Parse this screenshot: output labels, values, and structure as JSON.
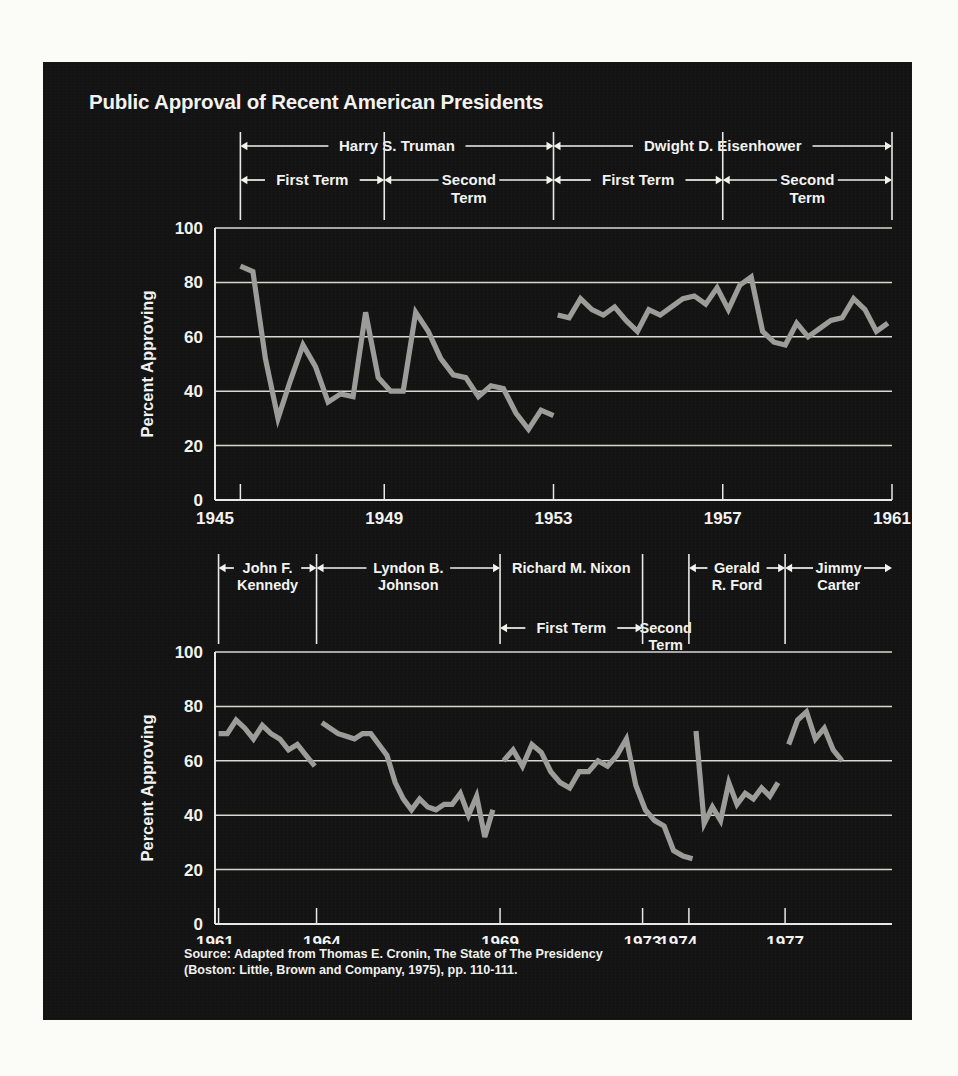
{
  "title": "Public Approval of Recent American Presidents",
  "source": "Source: Adapted from Thomas E. Cronin, The State of The Presidency\n(Boston: Little, Brown and Company, 1975), pp. 110-111.",
  "colors": {
    "panel_background": "#131313",
    "page_background": "#fbfbf8",
    "text": "#f2f2f0",
    "axis": "#e8e8e6",
    "gridline": "#d8d8d4",
    "data_line": "#9c9c9a"
  },
  "axis": {
    "ylabel": "Percent Approving",
    "yticks": [
      0,
      20,
      40,
      60,
      80,
      100
    ],
    "ylim": [
      0,
      100
    ]
  },
  "top_chart": {
    "xticks": [
      "1945",
      "1949",
      "1953",
      "1957",
      "1961"
    ],
    "xlim": [
      1945,
      1961
    ],
    "brackets_row1": [
      {
        "label": "Harry S. Truman",
        "start": 1945.6,
        "end": 1953.0
      },
      {
        "label": "Dwight D. Eisenhower",
        "start": 1953.0,
        "end": 1961.0
      }
    ],
    "brackets_row2": [
      {
        "label": "First Term",
        "start": 1945.6,
        "end": 1949.0
      },
      {
        "label": "Second\nTerm",
        "start": 1949.0,
        "end": 1953.0
      },
      {
        "label": "First Term",
        "start": 1953.0,
        "end": 1957.0
      },
      {
        "label": "Second\nTerm",
        "start": 1957.0,
        "end": 1961.0
      }
    ],
    "dividers": [
      1945.6,
      1949.0,
      1953.0,
      1957.0,
      1961.0
    ]
  },
  "bottom_chart": {
    "xticks": [
      "1961",
      "1964",
      "1969",
      "1973",
      "1974",
      "1977"
    ],
    "xlim": [
      1961,
      1980
    ],
    "brackets_row1": [
      {
        "label": "John F.\nKennedy",
        "start": 1961.1,
        "end": 1963.85
      },
      {
        "label": "Lyndon B.\nJohnson",
        "start": 1963.85,
        "end": 1969.0
      },
      {
        "label": "Richard M. Nixon",
        "start": 1969.0,
        "end": 1973.0
      },
      {
        "label": "Gerald\nR. Ford",
        "start": 1974.3,
        "end": 1977.0
      },
      {
        "label": "Jimmy\nCarter",
        "start": 1977.0,
        "end": 1980.0
      }
    ],
    "brackets_row2": [
      {
        "label": "First Term",
        "start": 1969.0,
        "end": 1973.0
      },
      {
        "label": "Second\nTerm",
        "start": 1973.0,
        "end": 1974.3
      }
    ],
    "dividers": [
      1961.1,
      1963.85,
      1969.0,
      1973.0,
      1974.3,
      1977.0
    ]
  },
  "chart_data": {
    "type": "line",
    "title": "Public Approval of Recent American Presidents",
    "xlabel": "",
    "ylabel": "Percent Approving",
    "ylim": [
      0,
      100
    ],
    "grid": true,
    "legend": "none",
    "panels": [
      {
        "name": "top",
        "xlim": [
          1945,
          1961
        ],
        "xticks": [
          1945,
          1949,
          1953,
          1957,
          1961
        ],
        "series": [
          {
            "name": "Harry S. Truman",
            "x": [
              1945.6,
              1945.9,
              1946.3,
              1946.7,
              1947.0,
              1947.3,
              1947.6,
              1948.0,
              1948.3,
              1948.6,
              1948.9,
              1949.1,
              1949.4,
              1949.8,
              1950.1,
              1950.4,
              1950.7,
              1951.0,
              1951.3,
              1951.6,
              1951.9,
              1952.2,
              1952.5,
              1952.8,
              1953.0
            ],
            "y": [
              86,
              84,
              52,
              30,
              44,
              57,
              49,
              36,
              39,
              38,
              69,
              45,
              40,
              40,
              69,
              62,
              52,
              46,
              45,
              38,
              42,
              41,
              32,
              26,
              33,
              31
            ]
          },
          {
            "name": "Dwight D. Eisenhower",
            "x": [
              1953.1,
              1953.4,
              1953.7,
              1954.0,
              1954.3,
              1954.6,
              1954.9,
              1955.2,
              1955.5,
              1955.8,
              1956.1,
              1956.4,
              1956.7,
              1957.0,
              1957.3,
              1957.6,
              1957.9,
              1958.2,
              1958.5,
              1958.8,
              1959.1,
              1959.4,
              1959.7,
              1960.0,
              1960.3,
              1960.6,
              1960.9
            ],
            "y": [
              68,
              67,
              74,
              70,
              68,
              71,
              66,
              62,
              70,
              68,
              71,
              74,
              75,
              72,
              78,
              70,
              79,
              82,
              62,
              58,
              57,
              65,
              60,
              63,
              66,
              67,
              74,
              70,
              62,
              65
            ]
          }
        ]
      },
      {
        "name": "bottom",
        "xlim": [
          1961,
          1980
        ],
        "xticks": [
          1961,
          1964,
          1969,
          1973,
          1974,
          1977
        ],
        "series": [
          {
            "name": "John F. Kennedy",
            "x": [
              1961.1,
              1961.4,
              1961.7,
              1962.0,
              1962.3,
              1962.6,
              1962.9,
              1963.2,
              1963.5,
              1963.8
            ],
            "y": [
              70,
              70,
              75,
              72,
              68,
              73,
              70,
              68,
              64,
              66,
              62,
              58
            ]
          },
          {
            "name": "Lyndon B. Johnson",
            "x": [
              1964.0,
              1964.3,
              1964.6,
              1964.9,
              1965.2,
              1965.5,
              1965.8,
              1966.1,
              1966.4,
              1966.7,
              1967.0,
              1967.3,
              1967.6,
              1967.9,
              1968.2,
              1968.5,
              1968.8
            ],
            "y": [
              74,
              72,
              70,
              69,
              68,
              70,
              70,
              66,
              62,
              52,
              46,
              42,
              46,
              43,
              42,
              44,
              44,
              48,
              40,
              47,
              32,
              42
            ]
          },
          {
            "name": "Richard M. Nixon",
            "x": [
              1969.1,
              1969.4,
              1969.7,
              1970.0,
              1970.3,
              1970.6,
              1970.9,
              1971.2,
              1971.5,
              1971.8,
              1972.1,
              1972.4,
              1972.7,
              1973.0,
              1973.3,
              1973.6,
              1973.9,
              1974.2,
              1974.4
            ],
            "y": [
              60,
              64,
              58,
              66,
              63,
              56,
              52,
              50,
              56,
              56,
              60,
              58,
              62,
              68,
              51,
              42,
              38,
              36,
              27,
              25,
              24
            ]
          },
          {
            "name": "Gerald R. Ford",
            "x": [
              1974.5,
              1974.7,
              1975.0,
              1975.3,
              1975.6,
              1975.9,
              1976.2,
              1976.5,
              1976.8
            ],
            "y": [
              71,
              37,
              43,
              38,
              52,
              44,
              48,
              46,
              50,
              47,
              52
            ]
          },
          {
            "name": "Jimmy Carter",
            "x": [
              1977.1,
              1977.4,
              1977.7,
              1978.0,
              1978.3,
              1978.6
            ],
            "y": [
              66,
              75,
              78,
              68,
              72,
              64,
              60
            ]
          }
        ]
      }
    ]
  }
}
